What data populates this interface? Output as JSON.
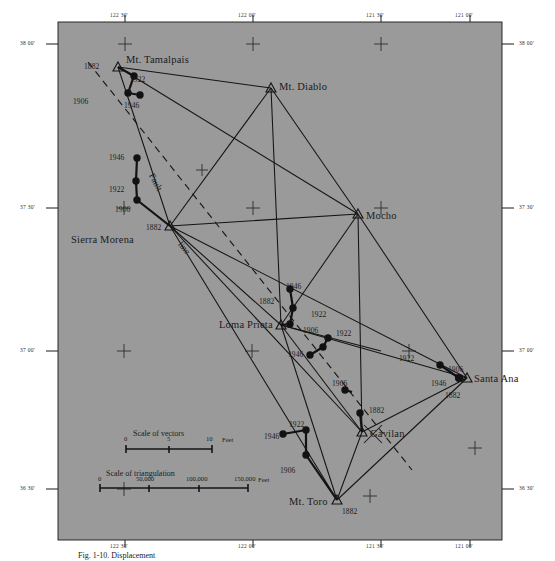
{
  "figure": {
    "caption": "Fig. 1-10. Displacement",
    "background_color": "#9a9a9a",
    "ink_color": "#1a1a1a"
  },
  "graticule": {
    "longitude_labels": [
      "122  30'",
      "122  00'",
      "121  30'",
      "121  00'"
    ],
    "latitude_labels": [
      "38  00'",
      "37  30'",
      "37  00'",
      "36  30'"
    ],
    "tick_marker": "plus-tick"
  },
  "stations": [
    {
      "name": "Mt. Tamalpais",
      "x": 118,
      "y": 67,
      "name_dx": 8,
      "name_dy": -12,
      "epochs": [
        {
          "year": "1882",
          "lx": -27,
          "ly": -4
        },
        {
          "year": "1922",
          "lx": 17,
          "ly": 9
        },
        {
          "year": "1906",
          "lx": -40,
          "ly": 31
        },
        {
          "year": "1946",
          "lx": 11,
          "ly": 35
        }
      ]
    },
    {
      "name": "Mt. Diablo",
      "x": 271,
      "y": 88,
      "name_dx": 8,
      "name_dy": -1,
      "epochs": []
    },
    {
      "name": "Sierra Morena",
      "x": 170,
      "y": 226,
      "name_dx": -99,
      "name_dy": 14,
      "epochs": [
        {
          "year": "1946",
          "lx": -62,
          "ly": -72
        },
        {
          "year": "1922",
          "lx": -62,
          "ly": -40
        },
        {
          "year": "1906",
          "lx": -56,
          "ly": -20
        },
        {
          "year": "1882",
          "lx": -25,
          "ly": -2
        }
      ]
    },
    {
      "name": "Mocho",
      "x": 358,
      "y": 214,
      "name_dx": 8,
      "name_dy": 2,
      "epochs": []
    },
    {
      "name": "Loma Prieta",
      "x": 281,
      "y": 325,
      "name_dx": -62,
      "name_dy": 1,
      "epochs": [
        {
          "year": "1946",
          "lx": 5,
          "ly": -42
        },
        {
          "year": "1882",
          "lx": -22,
          "ly": -27
        },
        {
          "year": "1922",
          "lx": 30,
          "ly": -14
        },
        {
          "year": "1906",
          "lx": 22,
          "ly": 2
        },
        {
          "year": "1922",
          "lx": 55,
          "ly": 5
        },
        {
          "year": "1946",
          "lx": 27,
          "ly": 26
        }
      ]
    },
    {
      "name": "Santa Ana",
      "x": 467,
      "y": 378,
      "name_dx": 7,
      "name_dy": 1,
      "epochs": [
        {
          "year": "1922",
          "lx": -68,
          "ly": -23
        },
        {
          "year": "1906",
          "lx": -19,
          "ly": -12
        },
        {
          "year": "1946",
          "lx": -36,
          "ly": 2
        },
        {
          "year": "1882",
          "lx": -22,
          "ly": 14
        }
      ]
    },
    {
      "name": "Gavilan",
      "x": 362,
      "y": 432,
      "name_dx": 8,
      "name_dy": 2,
      "epochs": [
        {
          "year": "1882",
          "lx": 7,
          "ly": -25
        },
        {
          "year": "1906",
          "lx": -30,
          "ly": -52
        }
      ]
    },
    {
      "name": "Mt. Toro",
      "x": 337,
      "y": 500,
      "name_dx": -48,
      "name_dy": 1,
      "epochs": [
        {
          "year": "1882",
          "lx": 5,
          "ly": 8
        },
        {
          "year": "1906",
          "lx": -57,
          "ly": -33
        },
        {
          "year": "1922",
          "lx": -48,
          "ly": -79
        },
        {
          "year": "1946",
          "lx": -73,
          "ly": -67
        }
      ]
    }
  ],
  "annotations": [
    {
      "id": "fault",
      "text": "Fault"
    },
    {
      "id": "line",
      "text": "line"
    }
  ],
  "scales": {
    "vectors": {
      "title": "Scale of vectors",
      "ticks": [
        "0",
        "5",
        "10"
      ],
      "unit": "Feet"
    },
    "triangulation": {
      "title": "Scale of triangulation",
      "ticks": [
        "0",
        "50,000",
        "100,000",
        "150,000"
      ],
      "unit": "Feet"
    }
  }
}
